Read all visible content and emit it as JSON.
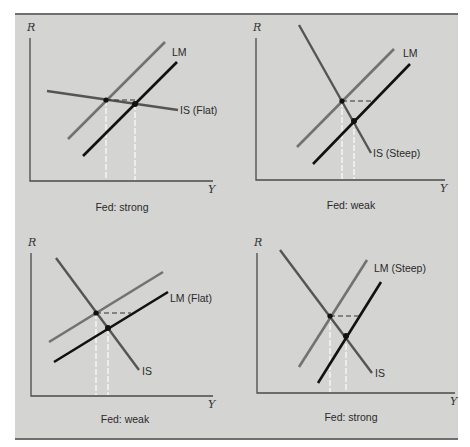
{
  "figure": {
    "colors": {
      "background": "#d4d4d2",
      "lm_original": "#727272",
      "lm_shifted": "#111111",
      "is_curve": "#555555",
      "guide_vertical": "#ffffff",
      "guide_horizontal": "#333333"
    },
    "panels": [
      {
        "id": "top-left",
        "caption": "Fed: strong",
        "y_axis_label": "R",
        "x_axis_label": "Y",
        "lm_label": "LM",
        "is_label": "IS (Flat)",
        "axes": {
          "x0": 30,
          "y0": 181,
          "xmax": 213,
          "ytop": 38
        },
        "is": [
          [
            47,
            91
          ],
          [
            178,
            110
          ]
        ],
        "lm_original": [
          [
            68,
            139
          ],
          [
            165,
            42
          ]
        ],
        "lm_shifted": [
          [
            83,
            156
          ],
          [
            177,
            62
          ]
        ],
        "eq1": [
          106,
          100
        ],
        "eq2": [
          135,
          104
        ],
        "dash_end_x": 138,
        "lm_label_pos": [
          172,
          56
        ],
        "is_label_pos": [
          180,
          114
        ],
        "caption_pos": [
          122,
          211
        ]
      },
      {
        "id": "top-right",
        "caption": "Fed: weak",
        "y_axis_label": "R",
        "x_axis_label": "Y",
        "lm_label": "LM",
        "is_label": "IS (Steep)",
        "axes": {
          "x0": 256,
          "y0": 180,
          "xmax": 445,
          "ytop": 38
        },
        "is": [
          [
            299,
            25
          ],
          [
            371,
            153
          ]
        ],
        "lm_original": [
          [
            297,
            147
          ],
          [
            394,
            49
          ]
        ],
        "lm_shifted": [
          [
            313,
            164
          ],
          [
            410,
            64
          ]
        ],
        "eq1": [
          342,
          101
        ],
        "eq2": [
          354,
          121
        ],
        "dash_end_x": 374,
        "lm_label_pos": [
          403,
          57
        ],
        "is_label_pos": [
          373,
          157
        ],
        "caption_pos": [
          351,
          209
        ]
      },
      {
        "id": "bottom-left",
        "caption": "Fed: weak",
        "y_axis_label": "R",
        "x_axis_label": "Y",
        "lm_label": "LM (Flat)",
        "is_label": "IS",
        "axes": {
          "x0": 31,
          "y0": 396,
          "xmax": 213,
          "ytop": 253
        },
        "is": [
          [
            56,
            258
          ],
          [
            139,
            370
          ]
        ],
        "lm_original": [
          [
            49,
            342
          ],
          [
            163,
            272
          ]
        ],
        "lm_shifted": [
          [
            54,
            362
          ],
          [
            168,
            292
          ]
        ],
        "eq1": [
          96,
          313
        ],
        "eq2": [
          108,
          328
        ],
        "dash_end_x": 131,
        "lm_label_pos": [
          170,
          302
        ],
        "is_label_pos": [
          142,
          375
        ],
        "caption_pos": [
          125,
          423
        ]
      },
      {
        "id": "bottom-right",
        "caption": "Fed: strong",
        "y_axis_label": "R",
        "x_axis_label": "Y",
        "lm_label": "LM (Steep)",
        "is_label": "IS",
        "axes": {
          "x0": 257,
          "y0": 393,
          "xmax": 455,
          "ytop": 253
        },
        "is": [
          [
            280,
            250
          ],
          [
            372,
            373
          ]
        ],
        "lm_original": [
          [
            299,
            367
          ],
          [
            367,
            260
          ]
        ],
        "lm_shifted": [
          [
            318,
            383
          ],
          [
            381,
            282
          ]
        ],
        "eq1": [
          330,
          316
        ],
        "eq2": [
          346,
          336
        ],
        "dash_end_x": 361,
        "lm_label_pos": [
          374,
          272
        ],
        "is_label_pos": [
          375,
          377
        ],
        "caption_pos": [
          351,
          421
        ]
      }
    ]
  }
}
